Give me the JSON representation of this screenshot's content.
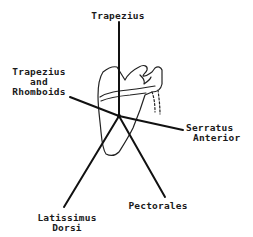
{
  "diagram": {
    "colors": {
      "line": "#111111",
      "outline": "#222222",
      "background": "#ffffff"
    },
    "labels": {
      "top": "Trapezius",
      "upper_left_line1": "Trapezius",
      "upper_left_line2": "and",
      "upper_left_line3": "Rhomboids",
      "right_line1": "Serratus",
      "right_line2": "Anterior",
      "lower_left_line1": "Latissimus",
      "lower_left_line2": "Dorsi",
      "lower_right": "Pectorales"
    },
    "force_lines": [
      {
        "name": "Trapezius",
        "from": [
          119,
          116
        ],
        "to": [
          119,
          22
        ]
      },
      {
        "name": "Trapezius and Rhomboids",
        "from": [
          119,
          116
        ],
        "to": [
          70,
          97
        ]
      },
      {
        "name": "Serratus Anterior",
        "from": [
          119,
          116
        ],
        "to": [
          183,
          130
        ]
      },
      {
        "name": "Latissimus Dorsi",
        "from": [
          119,
          116
        ],
        "to": [
          64,
          207
        ]
      },
      {
        "name": "Pectorales",
        "from": [
          119,
          116
        ],
        "to": [
          165,
          197
        ]
      }
    ]
  }
}
